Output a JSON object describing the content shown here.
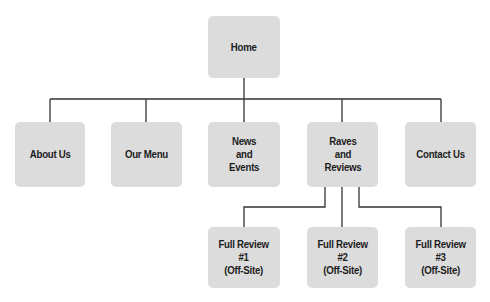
{
  "diagram": {
    "type": "site-map",
    "colors": {
      "node_fill": "#dcdcdc",
      "node_text": "#1c1c1c",
      "connector": "#333333",
      "background": "#ffffff"
    },
    "root": {
      "id": "home",
      "label": "Home"
    },
    "level1": [
      {
        "id": "about-us",
        "label": "About Us"
      },
      {
        "id": "our-menu",
        "label": "Our Menu"
      },
      {
        "id": "news-and-events",
        "label": "News\nand\nEvents"
      },
      {
        "id": "raves-and-reviews",
        "label": "Raves\nand\nReviews"
      },
      {
        "id": "contact-us",
        "label": "Contact Us"
      }
    ],
    "level2": [
      {
        "id": "full-review-1",
        "parent": "raves-and-reviews",
        "label": "Full Review\n#1\n(Off-Site)"
      },
      {
        "id": "full-review-2",
        "parent": "raves-and-reviews",
        "label": "Full Review\n#2\n(Off-Site)"
      },
      {
        "id": "full-review-3",
        "parent": "raves-and-reviews",
        "label": "Full Review\n#3\n(Off-Site)"
      }
    ]
  }
}
